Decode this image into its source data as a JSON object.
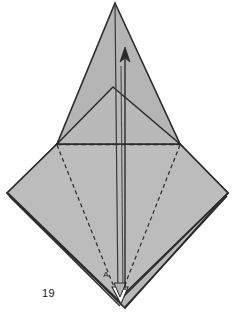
{
  "figure": {
    "caption": "19",
    "caption_label": "figure-number",
    "type": "origami-folding-diagram",
    "background_color": "#ffffff",
    "paper_fill_color": "#b8b8b8",
    "paper_fill_color_light": "#c2c2c2",
    "line_color": "#2b2b2b",
    "dashed_line_color": "#2b2b2b",
    "point_labels": [
      {
        "name": "point-a",
        "text": "A",
        "x": 110,
        "y": 275
      }
    ],
    "arrow": {
      "name": "fold-direction-arrow",
      "direction": "up",
      "tail_x": 125,
      "tail_y": 290,
      "head_x": 125,
      "head_y": 48
    },
    "geometry": {
      "apex_top": [
        115,
        3
      ],
      "inner_apex": [
        113,
        87
      ],
      "left_mid": [
        57,
        144
      ],
      "right_mid": [
        180,
        144
      ],
      "left_point": [
        7,
        193
      ],
      "right_point": [
        228,
        193
      ],
      "bottom_point": [
        118,
        300
      ]
    }
  }
}
